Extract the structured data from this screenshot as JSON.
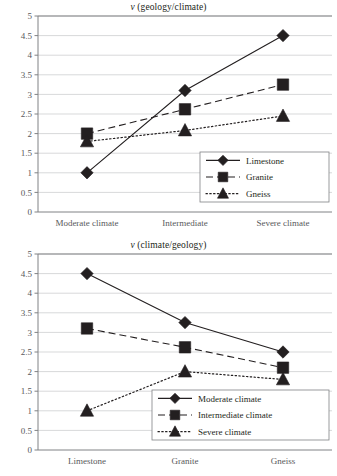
{
  "chart_data": [
    {
      "type": "line",
      "title": "ν (geology/climate)",
      "title_symbol": "ν",
      "title_rest": " (geology/climate)",
      "xlabel": "",
      "ylabel": "",
      "categories": [
        "Moderate climate",
        "Intermediate",
        "Severe climate"
      ],
      "yticks": [
        "0",
        "0.5",
        "1",
        "1.5",
        "2",
        "2.5",
        "3",
        "3.5",
        "4",
        "4.5",
        "5"
      ],
      "ylim": [
        0,
        5
      ],
      "grid": "horizontal",
      "legend_position": "lower-right",
      "series": [
        {
          "name": "Limestone",
          "marker": "diamond",
          "line": "solid",
          "color": "#231f20",
          "values": [
            1.0,
            3.1,
            4.5
          ]
        },
        {
          "name": "Granite",
          "marker": "square",
          "line": "dashed",
          "color": "#231f20",
          "values": [
            2.0,
            2.62,
            3.25
          ]
        },
        {
          "name": "Gneiss",
          "marker": "triangle",
          "line": "dotted",
          "color": "#231f20",
          "values": [
            1.8,
            2.08,
            2.45
          ]
        }
      ]
    },
    {
      "type": "line",
      "title": "ν (climate/geology)",
      "title_symbol": "ν",
      "title_rest": " (climate/geology)",
      "xlabel": "",
      "ylabel": "",
      "categories": [
        "Limestone",
        "Granite",
        "Gneiss"
      ],
      "yticks": [
        "0",
        "0.5",
        "1",
        "1.5",
        "2",
        "2.5",
        "3",
        "3.5",
        "4",
        "4.5",
        "5"
      ],
      "ylim": [
        0,
        5
      ],
      "grid": "horizontal",
      "legend_position": "lower-right",
      "series": [
        {
          "name": "Moderate climate",
          "marker": "diamond",
          "line": "solid",
          "color": "#231f20",
          "values": [
            4.5,
            3.25,
            2.5
          ]
        },
        {
          "name": "Intermediate climate",
          "marker": "square",
          "line": "dashed",
          "color": "#231f20",
          "values": [
            3.1,
            2.62,
            2.1
          ]
        },
        {
          "name": "Severe climate",
          "marker": "triangle",
          "line": "dotted",
          "color": "#231f20",
          "values": [
            1.0,
            2.0,
            1.8
          ]
        }
      ]
    }
  ],
  "figures": [
    {
      "id": "figure-geology-climate",
      "index": 0
    },
    {
      "id": "figure-climate-geology",
      "index": 1
    }
  ],
  "style": {
    "ink": "#231f20",
    "grid_color": "#c7c8ca",
    "axis_color": "#808285",
    "tick_color": "#58595b",
    "background": "#ffffff"
  }
}
